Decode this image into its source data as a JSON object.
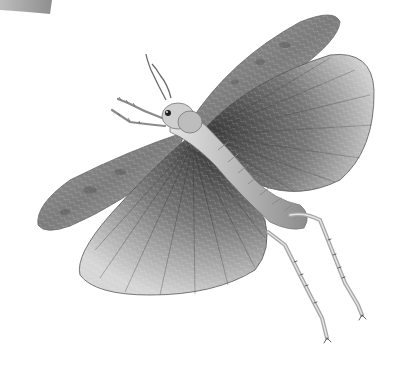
{
  "image": {
    "subject": "Grasshopper in flight, grayscale engraving-style illustration",
    "background_color": "#ffffff",
    "palette": {
      "dark": "#4a4a4a",
      "mid": "#8a8a8a",
      "light": "#c8c8c8",
      "highlight": "#e8e8e8"
    },
    "elements": [
      {
        "name": "wing-fragment-top-left",
        "description": "Partial wing edge at top-left corner"
      },
      {
        "name": "forewing-upper-right",
        "description": "Narrow mottled forewing extending to upper right"
      },
      {
        "name": "hindwing-right",
        "description": "Large fan-shaped hindwing on the right"
      },
      {
        "name": "forewing-left",
        "description": "Narrow mottled forewing extending to the left"
      },
      {
        "name": "hindwing-lower",
        "description": "Large fan-shaped hindwing hanging below"
      },
      {
        "name": "head",
        "description": "Head with eye and antennae"
      },
      {
        "name": "antennae",
        "description": "Two antennae pointing up"
      },
      {
        "name": "front-legs",
        "description": "Two spiny front legs pointing left"
      },
      {
        "name": "abdomen",
        "description": "Segmented abdomen"
      },
      {
        "name": "hind-legs",
        "description": "Two long spiny hind legs hanging down right"
      }
    ]
  }
}
